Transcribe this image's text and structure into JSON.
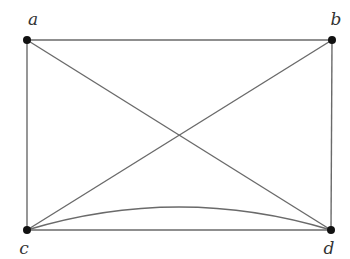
{
  "diagram": {
    "type": "graph",
    "vertices": [
      {
        "id": "a",
        "label": "a",
        "x": 27,
        "y": 40,
        "label_x": 33,
        "label_y": 25
      },
      {
        "id": "b",
        "label": "b",
        "x": 332,
        "y": 40,
        "label_x": 336,
        "label_y": 25
      },
      {
        "id": "c",
        "label": "c",
        "x": 27,
        "y": 230,
        "label_x": 24,
        "label_y": 254
      },
      {
        "id": "d",
        "label": "d",
        "x": 331,
        "y": 230,
        "label_x": 329,
        "label_y": 254
      }
    ],
    "edges": [
      {
        "from": "a",
        "to": "b",
        "shape": "straight"
      },
      {
        "from": "a",
        "to": "c",
        "shape": "straight"
      },
      {
        "from": "b",
        "to": "d",
        "shape": "straight"
      },
      {
        "from": "c",
        "to": "d",
        "shape": "straight"
      },
      {
        "from": "a",
        "to": "d",
        "shape": "straight"
      },
      {
        "from": "b",
        "to": "c",
        "shape": "straight"
      },
      {
        "from": "c",
        "to": "d",
        "shape": "curved",
        "control_y": 184
      }
    ],
    "colors": {
      "edge": "#6a6a6a",
      "vertex": "#111111",
      "label": "#333333",
      "background": "#ffffff"
    }
  }
}
